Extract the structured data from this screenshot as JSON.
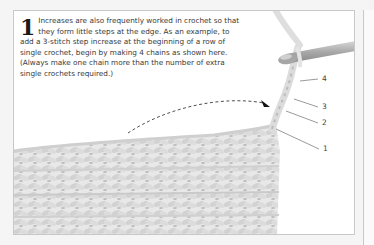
{
  "step": {
    "number": "1",
    "text": "Increases are also frequently worked in crochet so that they form little steps at the edge. As an example, to add a 3-stitch step increase at the beginning of a row of single crochet, begin by making 4 chains as shown here. (Always make one chain more than the number of extra single crochets required.)"
  },
  "illustration": {
    "chain_labels": [
      "4",
      "3",
      "2",
      "1"
    ],
    "colors": {
      "yarn": "#e6e6e6",
      "yarn_shadow": "#c4c4c4",
      "hook": "#b8b8b8",
      "arrow": "#222222"
    }
  }
}
